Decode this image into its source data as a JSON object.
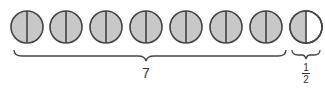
{
  "diagram": {
    "circles": {
      "count": 8,
      "whole_halved_count": 7,
      "last_shaded_halves": 1,
      "fill_color": "#c8c8c8",
      "empty_color": "#ffffff",
      "stroke_color": "#444444"
    },
    "group_label": "7",
    "fraction_label": {
      "numerator": "1",
      "denominator": "2"
    }
  }
}
